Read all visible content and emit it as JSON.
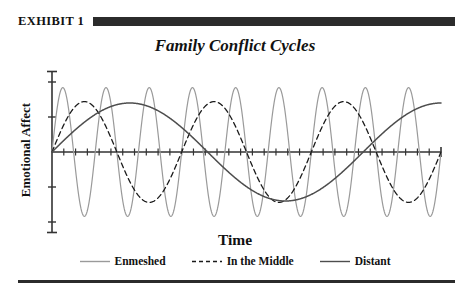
{
  "exhibit": {
    "label": "EXHIBIT 1"
  },
  "chart_data": {
    "type": "line",
    "title": "Family Conflict Cycles",
    "xlabel": "Time",
    "ylabel": "Emotional Affect",
    "grid": false,
    "legend_position": "bottom",
    "xlim": [
      0,
      1
    ],
    "ylim": [
      -1.15,
      1.15
    ],
    "x_axis": {
      "tick_count": 32,
      "tick_labels": [],
      "axis_y_value": 0,
      "note": "unlabeled tick marks along zero line"
    },
    "y_axis": {
      "tick_values": [
        -1,
        -0.5,
        0,
        0.5,
        1
      ],
      "tick_labels": [],
      "note": "unlabeled tick marks"
    },
    "series": [
      {
        "name": "Enmeshed",
        "color": "#9a9a9a",
        "dash": "solid",
        "width": 1.2,
        "wave": {
          "amplitude": 0.92,
          "cycles": 9.0,
          "phase": 0.0
        },
        "description": "high-frequency, high-amplitude oscillation"
      },
      {
        "name": "In the Middle",
        "color": "#1a1a1a",
        "dash": "dashed",
        "width": 1.3,
        "wave": {
          "amplitude": 0.72,
          "cycles": 3.0,
          "phase": 0.0
        },
        "description": "moderate-frequency, moderate-amplitude oscillation"
      },
      {
        "name": "Distant",
        "color": "#4d4d4d",
        "dash": "solid",
        "width": 1.5,
        "wave": {
          "amplitude": 0.7,
          "cycles": 1.25,
          "phase": 0.0
        },
        "description": "low-frequency, low-amplitude oscillation"
      }
    ]
  },
  "legend": {
    "items": [
      {
        "label": "Enmeshed",
        "color": "#9a9a9a",
        "dash": "solid"
      },
      {
        "label": "In the Middle",
        "color": "#1a1a1a",
        "dash": "dashed"
      },
      {
        "label": "Distant",
        "color": "#4d4d4d",
        "dash": "solid"
      }
    ]
  }
}
